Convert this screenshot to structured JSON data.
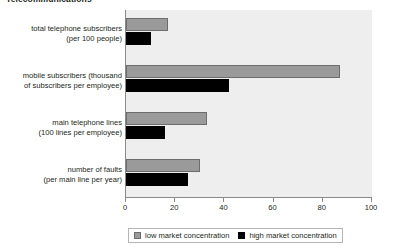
{
  "chart_data": {
    "type": "bar",
    "orientation": "horizontal",
    "title": "Telecommunications",
    "xlabel": "",
    "ylabel": "",
    "xlim": [
      0,
      100
    ],
    "xticks": [
      0,
      20,
      40,
      60,
      80,
      100
    ],
    "grid": false,
    "legend_position": "bottom",
    "categories": [
      {
        "line1": "total telephone subscribers",
        "line2": "(per 100 people)"
      },
      {
        "line1": "mobile subscribers (thousand",
        "line2": "of subscribers per employee)"
      },
      {
        "line1": "main telephone lines",
        "line2": "(100 lines per employee)"
      },
      {
        "line1": "number of faults",
        "line2": "(per main line per year)"
      }
    ],
    "series": [
      {
        "name": "low market concentration",
        "color": "#9a9a9a",
        "values": [
          17,
          87,
          33,
          30
        ]
      },
      {
        "name": "high market concentration",
        "color": "#000000",
        "values": [
          10,
          42,
          16,
          25
        ]
      }
    ]
  },
  "axis": {
    "tick_labels": [
      "0",
      "20",
      "40",
      "60",
      "80",
      "100"
    ]
  },
  "legend": {
    "items": [
      {
        "label": "low market concentration"
      },
      {
        "label": "high market concentration"
      }
    ]
  }
}
